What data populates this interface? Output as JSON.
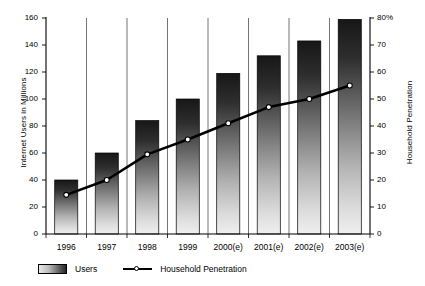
{
  "chart_data": {
    "type": "bar",
    "title": "",
    "subtitle": "",
    "xlabel": "",
    "ylabel": "Internet Users in Millions",
    "y2label": "Household Penetration",
    "categories": [
      "1996",
      "1997",
      "1998",
      "1999",
      "2000(e)",
      "2001(e)",
      "2002(e)",
      "2003(e)"
    ],
    "ylim": [
      0,
      160
    ],
    "y2lim": [
      0,
      80
    ],
    "yticks": [
      "0",
      "20",
      "40",
      "60",
      "80",
      "100",
      "120",
      "140",
      "160"
    ],
    "y2ticks": [
      "0",
      "10",
      "20",
      "30",
      "40",
      "50",
      "60",
      "70",
      "80%"
    ],
    "grid": false,
    "legend_position": "bottom-left",
    "series": [
      {
        "name": "Users",
        "type": "bar",
        "axis": "left",
        "unit": "millions",
        "values": [
          40,
          60,
          84,
          100,
          119,
          132,
          143,
          159
        ]
      },
      {
        "name": "Household Penetration",
        "type": "line",
        "axis": "right",
        "unit": "percent",
        "marker": "open-circle",
        "values": [
          14.5,
          20,
          29.5,
          35,
          41,
          47,
          50,
          55
        ]
      }
    ]
  },
  "legend": {
    "items": [
      {
        "label": "Users",
        "swatch": "bar-gradient-swatch"
      },
      {
        "label": "Household Penetration",
        "swatch": "line-marker-swatch"
      }
    ]
  },
  "colors": {
    "bar_top": "#171717",
    "bar_bottom": "#ededed",
    "line": "#000000",
    "marker_fill": "#ffffff",
    "axis": "#000000",
    "background": "#ffffff"
  }
}
